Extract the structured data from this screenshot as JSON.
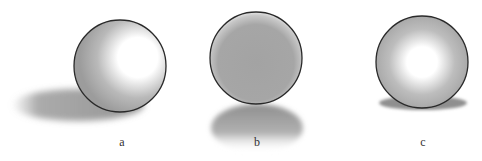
{
  "figure": {
    "panels": [
      {
        "id": "a",
        "label": "a",
        "description": "sphere lit from upper right, long cast shadow to the left"
      },
      {
        "id": "b",
        "label": "b",
        "description": "uniformly gray sphere, shadow directly below"
      },
      {
        "id": "c",
        "label": "c",
        "description": "sphere lit from front, small shadow beneath"
      }
    ],
    "colors": {
      "outline": "#2a2a2a",
      "shade": "#9a9a9a",
      "highlight": "#ffffff",
      "shadow": "#8f8f8f"
    }
  }
}
